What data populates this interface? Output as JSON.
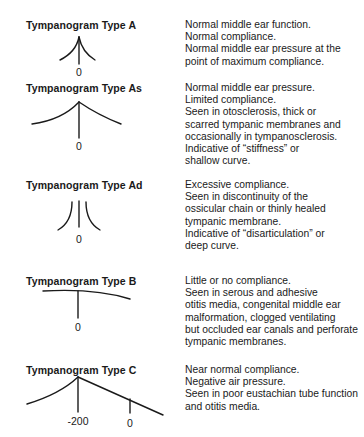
{
  "diagram": {
    "types": [
      {
        "title": "Tympanogram Type A",
        "axis_label": "0",
        "description": [
          "Normal middle ear function.",
          "Normal compliance.",
          "Normal middle ear pressure at the",
          "point of maximum compliance."
        ]
      },
      {
        "title": "Tympanogram Type As",
        "axis_label": "0",
        "description": [
          "Normal middle ear pressure.",
          "Limited compliance.",
          "Seen in otosclerosis, thick or",
          "scarred tympanic membranes and",
          "occasionally in tympanosclerosis.",
          "Indicative of “stiffness” or",
          "shallow curve."
        ]
      },
      {
        "title": "Tympanogram Type Ad",
        "axis_label": "0",
        "description": [
          "Excessive compliance.",
          "Seen in discontinuity of the",
          "ossicular chain or thinly healed",
          "tympanic membrane.",
          "Indicative of “disarticulation” or",
          "deep curve."
        ]
      },
      {
        "title": "Tympanogram Type B",
        "axis_label": "0",
        "description": [
          "Little or no compliance.",
          "Seen in serous and adhesive",
          "otitis media, congenital middle ear",
          "malformation, clogged ventilating",
          "but occluded ear canals and perforate",
          "tympanic membranes."
        ]
      },
      {
        "title": "Tympanogram Type C",
        "axis_labels": [
          "-200",
          "0"
        ],
        "description": [
          "Near normal compliance.",
          "Negative air pressure.",
          "Seen in poor eustachian tube function",
          "and otitis media."
        ]
      }
    ],
    "colors": {
      "ink": "#1a1a1a",
      "background": "#ffffff"
    }
  }
}
